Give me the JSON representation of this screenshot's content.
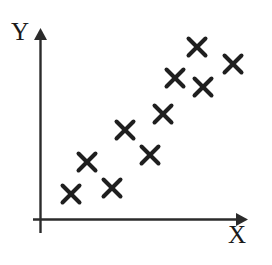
{
  "figure": {
    "width": 272,
    "height": 265,
    "background": "#ffffff",
    "ink_color": "#262626",
    "marker_color": "#1f1f1f"
  },
  "axes": {
    "x_axis": {
      "label": "X",
      "label_name": "x-axis-label",
      "origin_x": 40,
      "y": 219,
      "end_x": 243,
      "arrow": "right"
    },
    "y_axis": {
      "label": "Y",
      "label_name": "y-axis-label",
      "x": 40,
      "origin_y": 219,
      "end_y": 30,
      "bottom_overrun_y": 233,
      "arrow": "up"
    }
  },
  "chart_data": {
    "type": "scatter",
    "title": "",
    "xlabel": "X",
    "ylabel": "Y",
    "grid": false,
    "legend": null,
    "marker": "x",
    "marker_size": 17,
    "marker_stroke_width": 4,
    "marker_color": "#1f1f1f",
    "n_points": 10,
    "axis_units": "unlabeled",
    "xlim": [
      0,
      1
    ],
    "ylim": [
      0,
      1
    ],
    "pixel_points": [
      {
        "x": 71,
        "y": 194
      },
      {
        "x": 87,
        "y": 162
      },
      {
        "x": 112,
        "y": 188
      },
      {
        "x": 125,
        "y": 130
      },
      {
        "x": 150,
        "y": 155
      },
      {
        "x": 163,
        "y": 114
      },
      {
        "x": 175,
        "y": 78
      },
      {
        "x": 197,
        "y": 47
      },
      {
        "x": 203,
        "y": 87
      },
      {
        "x": 233,
        "y": 64
      }
    ],
    "x": [
      0.153,
      0.231,
      0.354,
      0.419,
      0.542,
      0.606,
      0.665,
      0.773,
      0.803,
      0.951
    ],
    "y": [
      0.132,
      0.301,
      0.164,
      0.471,
      0.339,
      0.556,
      0.746,
      0.91,
      0.698,
      0.82
    ]
  }
}
